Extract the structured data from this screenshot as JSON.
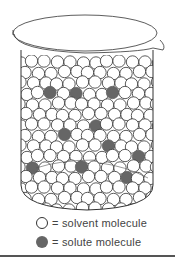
{
  "figure": {
    "colors": {
      "solvent_fill": "#ffffff",
      "solvent_stroke": "#333333",
      "solute_fill": "#666666",
      "line": "#333333"
    },
    "solute_positions": [
      [
        51,
        96
      ],
      [
        76,
        96
      ],
      [
        112,
        92
      ],
      [
        38,
        127
      ],
      [
        91,
        126
      ],
      [
        62,
        140
      ],
      [
        108,
        150
      ],
      [
        140,
        158
      ],
      [
        38,
        165
      ],
      [
        81,
        163
      ],
      [
        127,
        176
      ]
    ]
  },
  "legend": {
    "items": [
      {
        "symbol": "open-circle",
        "label": "= solvent molecule"
      },
      {
        "symbol": "filled-circle",
        "label": "= solute molecule"
      }
    ]
  }
}
